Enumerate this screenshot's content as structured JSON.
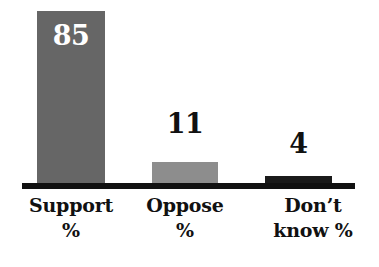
{
  "chart_data": {
    "type": "bar",
    "title": "",
    "subtitle": "",
    "xlabel": "",
    "ylabel": "",
    "categories": [
      "Support %",
      "Oppose %",
      "Don't know %"
    ],
    "values": [
      85,
      11,
      4
    ],
    "value_labels": [
      "85",
      "11",
      "4"
    ],
    "ylim": [
      0,
      85
    ],
    "grid": false,
    "legend": null,
    "axis": {
      "baseline_visible": true,
      "y_axis_visible": false,
      "tick_labels": []
    },
    "bars": [
      {
        "category_lines": [
          "Support",
          "%"
        ],
        "category": "Support %",
        "value": 85,
        "value_label": "85",
        "color": "#666666",
        "label_color": "#ffffff",
        "label_position": "inside"
      },
      {
        "category_lines": [
          "Oppose",
          "%"
        ],
        "category": "Oppose %",
        "value": 11,
        "value_label": "11",
        "color": "#8d8d8d",
        "label_color": "#111111",
        "label_position": "above"
      },
      {
        "category_lines": [
          "Don’t",
          "know %"
        ],
        "category": "Don’t know %",
        "value": 4,
        "value_label": "4",
        "color": "#1a1a1a",
        "label_color": "#111111",
        "label_position": "above"
      }
    ],
    "colors": {
      "background": "#ffffff",
      "axis": "#111111",
      "bar_support": "#666666",
      "bar_oppose": "#8d8d8d",
      "bar_dontknow": "#1a1a1a",
      "text": "#111111",
      "text_inverse": "#ffffff"
    }
  }
}
